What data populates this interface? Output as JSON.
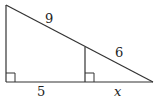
{
  "diagram": {
    "type": "similar-right-triangles",
    "labels": {
      "large_hypotenuse_upper": "9",
      "small_hypotenuse": "6",
      "large_base_left": "5",
      "small_base": "x"
    },
    "geometry": {
      "top_left": [
        6,
        5
      ],
      "bottom_left": [
        6,
        82
      ],
      "bottom_right": [
        153,
        82
      ],
      "inner_top": [
        85,
        47
      ],
      "inner_bottom": [
        85,
        82
      ]
    },
    "right_angle_markers": 2
  }
}
